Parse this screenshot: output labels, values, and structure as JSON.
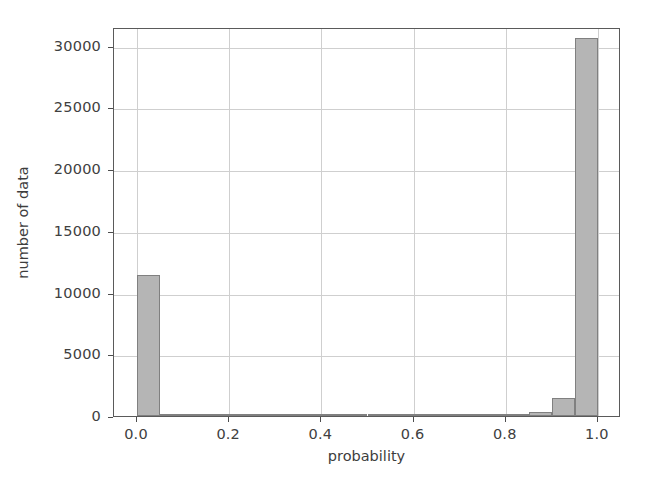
{
  "chart_data": {
    "type": "bar",
    "title": "",
    "subtitle": "",
    "xlabel": "probability",
    "ylabel": "number of data",
    "xlim": [
      -0.05,
      1.05
    ],
    "ylim": [
      0,
      31500
    ],
    "xticks": [
      "0.0",
      "0.2",
      "0.4",
      "0.6",
      "0.8",
      "1.0"
    ],
    "xtick_values": [
      0.0,
      0.2,
      0.4,
      0.6,
      0.8,
      1.0
    ],
    "yticks": [
      "0",
      "5000",
      "10000",
      "15000",
      "20000",
      "25000",
      "30000"
    ],
    "ytick_values": [
      0,
      5000,
      10000,
      15000,
      20000,
      25000,
      30000
    ],
    "grid": true,
    "legend": false,
    "bin_width": 0.05,
    "bin_edges": [
      0.0,
      0.05,
      0.1,
      0.15,
      0.2,
      0.25,
      0.3,
      0.35,
      0.4,
      0.45,
      0.5,
      0.55,
      0.6,
      0.65,
      0.7,
      0.75,
      0.8,
      0.85,
      0.9,
      0.95,
      1.0
    ],
    "categories": [
      "0.000",
      "0.050",
      "0.100",
      "0.150",
      "0.200",
      "0.250",
      "0.300",
      "0.350",
      "0.400",
      "0.450",
      "0.500",
      "0.550",
      "0.600",
      "0.650",
      "0.700",
      "0.750",
      "0.800",
      "0.850",
      "0.900",
      "0.950"
    ],
    "values": [
      11400,
      180,
      60,
      40,
      30,
      25,
      25,
      25,
      25,
      30,
      30,
      35,
      40,
      45,
      55,
      70,
      90,
      300,
      1450,
      30600
    ],
    "bar_color": "#b5b5b5",
    "bar_edge_color": "#808080",
    "grid_color": "#cfcfcf",
    "axes_color": "#5a5a5a",
    "background_color": "#ffffff"
  },
  "figure": {
    "background_color": "#ffffff"
  }
}
